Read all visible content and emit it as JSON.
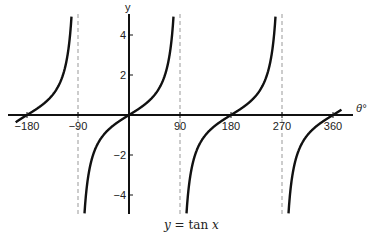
{
  "chart_data": {
    "type": "line",
    "title": "y = tan x",
    "caption": {
      "lhs": "y",
      "eq": " = ",
      "fn": "tan",
      "arg": "x"
    },
    "xlabel": "θ°",
    "ylabel": "y",
    "xlim": [
      -200,
      375
    ],
    "ylim": [
      -5,
      5
    ],
    "x_ticks": [
      -180,
      -90,
      90,
      180,
      270,
      360
    ],
    "x_tick_labels": [
      "−180",
      "−90",
      "90",
      "180",
      "270",
      "360"
    ],
    "y_ticks": [
      4,
      2,
      -2,
      -4
    ],
    "y_tick_labels": [
      "4",
      "2",
      "−2",
      "−4"
    ],
    "asymptotes": [
      -90,
      90,
      270
    ],
    "asymptote_style": "dashed gray",
    "grid": false,
    "legend": null,
    "series": [
      {
        "name": "y = tan x",
        "function": "tan(x°)",
        "domain": [
          -200,
          375
        ]
      }
    ],
    "zeros": [
      -180,
      0,
      180,
      360
    ]
  }
}
